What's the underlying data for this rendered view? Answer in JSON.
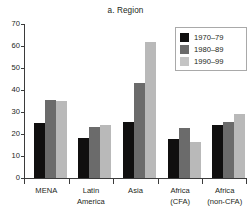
{
  "chart_data": {
    "type": "bar",
    "title": "a. Region",
    "xlabel": "",
    "ylabel": "",
    "ylim": [
      0,
      70
    ],
    "yticks": [
      0,
      10,
      20,
      30,
      40,
      50,
      60,
      70
    ],
    "grid": false,
    "legend_position": "top-right",
    "categories": [
      "MENA",
      "Latin America",
      "Asia",
      "Africa (CFA)",
      "Africa (non-CFA)"
    ],
    "category_lines": [
      [
        "MENA"
      ],
      [
        "Latin",
        "America"
      ],
      [
        "Asia"
      ],
      [
        "Africa",
        "(CFA)"
      ],
      [
        "Africa",
        "(non-CFA)"
      ]
    ],
    "series": [
      {
        "name": "1970–79",
        "color": "#100f0f",
        "values": [
          25.0,
          18.2,
          25.7,
          17.8,
          24.3
        ]
      },
      {
        "name": "1980–89",
        "color": "#6b6b6b",
        "values": [
          35.5,
          23.3,
          43.0,
          22.8,
          25.3
        ]
      },
      {
        "name": "1990–99",
        "color": "#c4c4c4",
        "values": [
          35.2,
          24.1,
          62.0,
          16.2,
          29.3
        ]
      }
    ]
  },
  "axis": {
    "tick_labels": [
      "70",
      "60",
      "50",
      "40",
      "30",
      "20",
      "10",
      "0"
    ]
  },
  "legend": {
    "entries": [
      {
        "label": "1970–79"
      },
      {
        "label": "1980–89"
      },
      {
        "label": "1990–99"
      }
    ]
  }
}
